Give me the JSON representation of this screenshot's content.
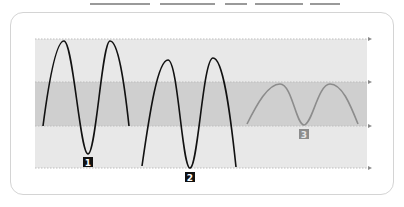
{
  "diagram": {
    "colors": {
      "background": "#ffffff",
      "frame_border": "#d4d4d4",
      "plot_area": "#e8e8e8",
      "band": "#cfcfcf",
      "curve_dark": "#111111",
      "curve_gray": "#8c8c8c",
      "guide_line": "#bdbdbd",
      "label_dark_bg": "#111111",
      "label_dark_text": "#ffffff",
      "label_gray_bg": "#8c8c8c",
      "label_gray_text": "#e6e6e6"
    },
    "labels": [
      {
        "id": "1",
        "text": "1"
      },
      {
        "id": "2",
        "text": "2"
      },
      {
        "id": "3",
        "text": "3"
      }
    ]
  }
}
